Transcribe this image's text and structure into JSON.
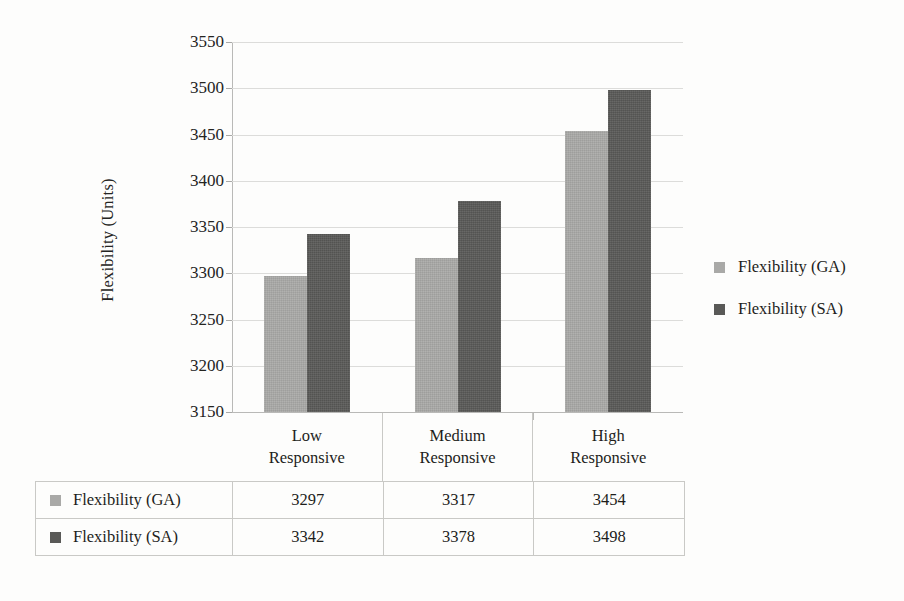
{
  "chart_data": {
    "type": "bar",
    "title": "",
    "xlabel": "",
    "ylabel": "Flexibility (Units)",
    "categories": [
      "Low Responsive",
      "Medium Responsive",
      "High Responsive"
    ],
    "category_lines": [
      [
        "Low",
        "Responsive"
      ],
      [
        "Medium",
        "Responsive"
      ],
      [
        "High",
        "Responsive"
      ]
    ],
    "series": [
      {
        "name": "Flexibility (GA)",
        "values": [
          3297,
          3317,
          3454
        ],
        "color": "#a9a9a7"
      },
      {
        "name": "Flexibility (SA)",
        "values": [
          3342,
          3378,
          3498
        ],
        "color": "#595957"
      }
    ],
    "ylim": [
      3150,
      3550
    ],
    "ytick_step": 50,
    "yticks": [
      3550,
      3500,
      3450,
      3400,
      3350,
      3300,
      3250,
      3200,
      3150
    ],
    "ytick_labels": [
      "3550",
      "3500",
      "3450",
      "3400",
      "3350",
      "3300",
      "3250",
      "3200",
      "3150"
    ],
    "grid": true,
    "grid_axis": "y",
    "legend_position": "right",
    "data_table_visible": true
  },
  "legend": {
    "items": [
      {
        "label": "Flexibility (GA)",
        "swatch": "ga"
      },
      {
        "label": "Flexibility (SA)",
        "swatch": "sa"
      }
    ]
  },
  "data_table": {
    "rows": [
      {
        "label": "Flexibility (GA)",
        "swatch": "ga",
        "values": [
          "3297",
          "3317",
          "3454"
        ]
      },
      {
        "label": "Flexibility (SA)",
        "swatch": "sa",
        "values": [
          "3342",
          "3378",
          "3498"
        ]
      }
    ]
  }
}
